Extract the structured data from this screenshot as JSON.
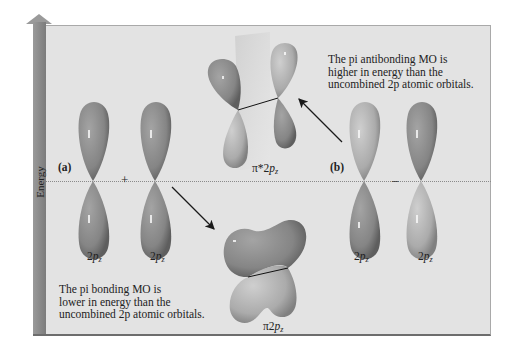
{
  "figure": {
    "axis": {
      "label": "Energy"
    },
    "panel_a": {
      "tag": "(a)",
      "operator": "+",
      "orbital_left_label": {
        "base": "2",
        "italic": "p",
        "sub": "z"
      },
      "orbital_right_label": {
        "base": "2",
        "italic": "p",
        "sub": "z"
      },
      "result_label": {
        "prefix": "π",
        "base": "2",
        "italic": "p",
        "sub": "z"
      },
      "caption_lines": [
        "The pi bonding MO is",
        "lower in energy than the",
        "uncombined 2p atomic orbitals."
      ]
    },
    "panel_b": {
      "tag": "(b)",
      "operator": "–",
      "orbital_left_label": {
        "base": "2",
        "italic": "p",
        "sub": "z"
      },
      "orbital_right_label": {
        "base": "2",
        "italic": "p",
        "sub": "z"
      },
      "result_label": {
        "prefix": "π*",
        "base": "2",
        "italic": "p",
        "sub": "z"
      },
      "caption_lines": [
        "The pi antibonding MO is",
        "higher in energy than the",
        "uncombined 2p atomic orbitals."
      ]
    },
    "colors": {
      "panel_bg": "#e3e3e3",
      "lobe_dark": "#8c8c8c",
      "lobe_light": "#b4b4b4",
      "arrow": "#1a1a1a",
      "energy_arrow": "#8a8a8a"
    }
  }
}
